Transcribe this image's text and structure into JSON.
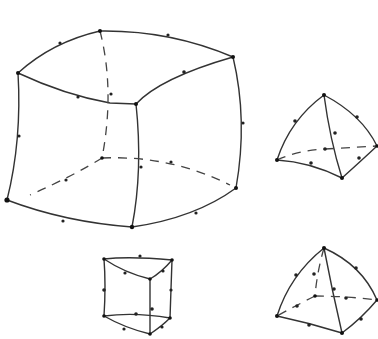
{
  "diagram": {
    "colors": {
      "line": "#333333",
      "node": "#222222",
      "background": "#ffffff"
    },
    "elements": [
      {
        "name": "hexahedron-20-node",
        "type": "curved hexahedron",
        "corner_nodes": 8,
        "midside_nodes": 12
      },
      {
        "name": "tetrahedron-10-node",
        "type": "curved tetrahedron",
        "corner_nodes": 4,
        "midside_nodes": 6
      },
      {
        "name": "wedge-15-node",
        "type": "triangular prism",
        "corner_nodes": 6,
        "midside_nodes": 9
      },
      {
        "name": "pyramid-13-node",
        "type": "pyramid",
        "corner_nodes": 5,
        "midside_nodes": 8
      }
    ]
  }
}
